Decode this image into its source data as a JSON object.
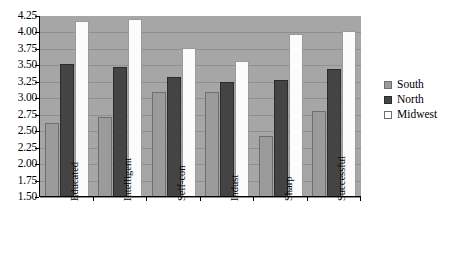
{
  "chart_data": {
    "type": "bar",
    "title": "",
    "xlabel": "",
    "ylabel": "",
    "categories": [
      "Educated",
      "Intelligent",
      "Self-con",
      "Indust",
      "Sharp",
      "Successful"
    ],
    "series": [
      {
        "name": "South",
        "color": "#9b9b9b",
        "values": [
          2.63,
          2.72,
          3.1,
          3.1,
          2.42,
          2.8
        ]
      },
      {
        "name": "North",
        "color": "#444444",
        "values": [
          3.52,
          3.47,
          3.32,
          3.25,
          3.28,
          3.45
        ]
      },
      {
        "name": "Midwest",
        "color": "#ffffff",
        "values": [
          4.17,
          4.2,
          3.77,
          3.57,
          3.98,
          4.02
        ]
      }
    ],
    "ylim": [
      1.5,
      4.25
    ],
    "ytick_step": 0.25,
    "yticks": [
      "4.25",
      "4.00",
      "3.75",
      "3.50",
      "3.25",
      "3.00",
      "2.75",
      "2.50",
      "2.25",
      "2.00",
      "1.75",
      "1.50"
    ],
    "grid": true,
    "legend_position": "right",
    "plot_background": "#a6a6a6"
  }
}
